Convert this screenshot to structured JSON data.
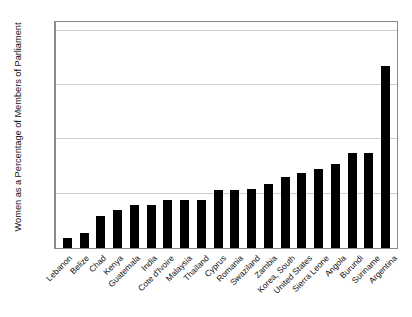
{
  "chart_data": {
    "type": "bar",
    "title": "",
    "xlabel": "",
    "ylabel": "Women as a Percentage of Members of Parliament",
    "ylim": [
      0,
      42
    ],
    "yticks": [
      0,
      10,
      20,
      30,
      40
    ],
    "ytick_labels": [
      "0",
      "10",
      "20",
      "30",
      "40"
    ],
    "grid": true,
    "legend": "none",
    "bar_color": "#000000",
    "categories": [
      "Lebanon",
      "Belize",
      "Chad",
      "Kenya",
      "Guatemala",
      "India",
      "Cote d'Ivoire",
      "Malaysia",
      "Thailand",
      "Cyprus",
      "Romania",
      "Swaziland",
      "Zambia",
      "Korea, South",
      "United States",
      "Sierra Leone",
      "Angola",
      "Burundi",
      "Suriname",
      "Argentina"
    ],
    "values": [
      1.8,
      2.7,
      5.9,
      7.0,
      8.0,
      8.0,
      8.9,
      8.9,
      8.9,
      10.6,
      10.7,
      10.8,
      11.8,
      13.0,
      13.8,
      14.5,
      15.5,
      17.5,
      17.5,
      33.5
    ]
  },
  "caption": {
    "text": ""
  }
}
